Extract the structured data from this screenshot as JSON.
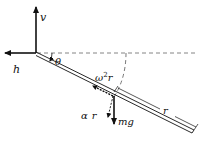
{
  "diagram": {
    "labels": {
      "v": "v",
      "h": "h",
      "theta": "θ",
      "omega2r_base": "ω",
      "omega2r_sup": "2",
      "omega2r_r": "r",
      "alpha": "α",
      "alpha_r": "r",
      "mg": "mg",
      "r_length": "r"
    },
    "colors": {
      "ink": "#111111",
      "dashed": "#555555",
      "background": "#ffffff"
    }
  }
}
